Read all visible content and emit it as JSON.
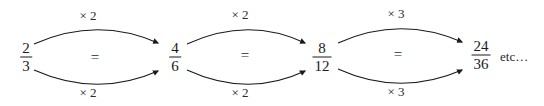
{
  "figure": {
    "background_color": "#ffffff",
    "ink_color": "#1a1a1a",
    "width": 544,
    "height": 106
  },
  "fractions": [
    {
      "name": "fraction-2-3",
      "numerator": "2",
      "denominator": "3",
      "x": 26,
      "y": 57
    },
    {
      "name": "fraction-4-6",
      "numerator": "4",
      "denominator": "6",
      "x": 175,
      "y": 57
    },
    {
      "name": "fraction-8-12",
      "numerator": "8",
      "denominator": "12",
      "x": 322,
      "y": 57
    },
    {
      "name": "fraction-24-36",
      "numerator": "24",
      "denominator": "36",
      "x": 481,
      "y": 55
    }
  ],
  "equals_signs": [
    {
      "name": "equals-sign-1",
      "text": "=",
      "x": 95,
      "y": 57
    },
    {
      "name": "equals-sign-2",
      "text": "=",
      "x": 245,
      "y": 55
    },
    {
      "name": "equals-sign-3",
      "text": "=",
      "x": 398,
      "y": 54
    }
  ],
  "operations": [
    {
      "name": "op-top-1",
      "text": "× 2",
      "x": 88,
      "y": 16,
      "position": "top",
      "group": 1
    },
    {
      "name": "op-bottom-1",
      "text": "× 2",
      "x": 88,
      "y": 93,
      "position": "bottom",
      "group": 1
    },
    {
      "name": "op-top-2",
      "text": "× 2",
      "x": 240,
      "y": 15,
      "position": "top",
      "group": 2
    },
    {
      "name": "op-bottom-2",
      "text": "× 2",
      "x": 240,
      "y": 93,
      "position": "bottom",
      "group": 2
    },
    {
      "name": "op-top-3",
      "text": "× 3",
      "x": 396,
      "y": 14,
      "position": "top",
      "group": 3
    },
    {
      "name": "op-bottom-3",
      "text": "× 3",
      "x": 396,
      "y": 92,
      "position": "bottom",
      "group": 3
    }
  ],
  "continuation": {
    "text": "etc…",
    "x": 500,
    "y": 57
  },
  "arrows": [
    {
      "name": "arrow-top-1",
      "from": "2/3",
      "to": "4/6",
      "label": "× 2",
      "path": "M 34,44 Q 97,16 158,43"
    },
    {
      "name": "arrow-bottom-1",
      "from": "2/3",
      "to": "4/6",
      "label": "× 2",
      "path": "M 34,70 Q 97,98 158,71"
    },
    {
      "name": "arrow-top-2",
      "from": "4/6",
      "to": "8/12",
      "label": "× 2",
      "path": "M 187,44 Q 248,16 305,43"
    },
    {
      "name": "arrow-bottom-2",
      "from": "4/6",
      "to": "8/12",
      "label": "× 2",
      "path": "M 187,70 Q 248,98 305,71"
    },
    {
      "name": "arrow-top-3",
      "from": "8/12",
      "to": "24/36",
      "label": "× 3",
      "path": "M 338,43 Q 400,15 462,42"
    },
    {
      "name": "arrow-bottom-3",
      "from": "8/12",
      "to": "24/36",
      "label": "× 3",
      "path": "M 338,69 Q 400,97 462,70"
    }
  ]
}
